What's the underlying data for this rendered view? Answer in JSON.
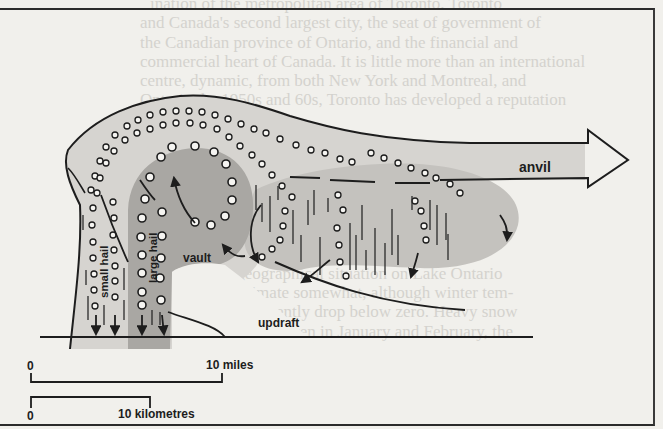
{
  "diagram": {
    "labels": {
      "anvil": "anvil",
      "vault": "vault",
      "updraft": "updraft",
      "small_hail": "small hail",
      "large_hail": "large hail"
    },
    "scale_bars": {
      "miles": {
        "zero": "0",
        "end_label": "10 miles"
      },
      "kilometres": {
        "zero": "0",
        "end_label": "10 kilometres"
      }
    },
    "colors": {
      "paper": "#f1f0ec",
      "cloud_light": "#d6d4d0",
      "cloud_mid": "#c6c4c0",
      "vault_dark": "#a9a7a3",
      "ink": "#1d1d1d"
    }
  },
  "background_bleed_text": [
    "ination of the metropolitan area of Toronto. Toronto",
    "and Canada's second largest city, the seat of government of",
    "the Canadian province of Ontario, and the financial and",
    "commercial heart of Canada. It is little more than an international",
    "centre, dynamic, from both New York and Montreal, and",
    "Ontario the 1950s and 60s, Toronto has developed a reputation",
    "from",
    "area of",
    "newcomers",
    "tarisa Canada",
    "community, its inner",
    "and a large number of Chinese, Polish, and other",
    "well finds its. The city has natural features are",
    "as the area its geographical situation on Lake Ontario",
    "moderates the climate somewhat, although winter tem-",
    "peratures may frequently drop below zero. Heavy snow",
    "fall, however, is rare even in January and February, the"
  ]
}
